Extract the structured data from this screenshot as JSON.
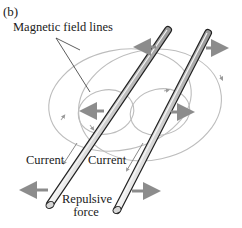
{
  "figure": {
    "panel_label": "(b)",
    "labels": {
      "field_lines": "Magnetic field lines",
      "current_left": "Current",
      "current_right": "Current",
      "force_line1": "Repulsive",
      "force_line2": "force"
    },
    "colors": {
      "field_line": "#b8b8b8",
      "force_arrow": "#8c8c8c",
      "rod_outline": "#222222",
      "rod_fill": "#d9d9d9",
      "text": "#1a1a1a"
    }
  }
}
